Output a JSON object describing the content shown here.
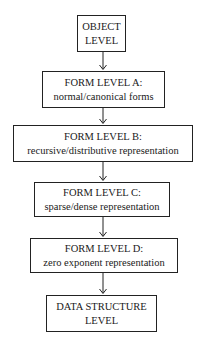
{
  "diagram": {
    "type": "flowchart",
    "direction": "top-to-bottom",
    "nodes": [
      {
        "id": "object",
        "lines": [
          "OBJECT",
          "LEVEL"
        ]
      },
      {
        "id": "form_a",
        "lines": [
          "FORM LEVEL A:",
          "normal/canonical forms"
        ]
      },
      {
        "id": "form_b",
        "lines": [
          "FORM LEVEL B:",
          "recursive/distributive representation"
        ]
      },
      {
        "id": "form_c",
        "lines": [
          "FORM LEVEL C:",
          "sparse/dense representation"
        ]
      },
      {
        "id": "form_d",
        "lines": [
          "FORM LEVEL D:",
          "zero exponent representation"
        ]
      },
      {
        "id": "data_structure",
        "lines": [
          "DATA STRUCTURE",
          "LEVEL"
        ]
      }
    ],
    "edges": [
      {
        "from": "object",
        "to": "form_a"
      },
      {
        "from": "form_a",
        "to": "form_b"
      },
      {
        "from": "form_b",
        "to": "form_c"
      },
      {
        "from": "form_c",
        "to": "form_d"
      },
      {
        "from": "form_d",
        "to": "data_structure"
      }
    ],
    "colors": {
      "line": "#222222",
      "text": "#1a1a1a",
      "background": "#ffffff"
    }
  }
}
